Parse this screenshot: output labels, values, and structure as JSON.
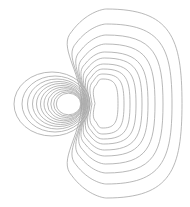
{
  "diagram": {
    "title": "",
    "type": "contour-field-lines",
    "stroke_color": "#a6a6a6",
    "background": "#ffffff",
    "left_lobe": {
      "center": [
        52,
        104
      ],
      "contours": [
        {
          "rx": 38,
          "ry": 32,
          "cx": 52,
          "cy": 104
        },
        {
          "rx": 33,
          "ry": 28,
          "cx": 55,
          "cy": 104
        },
        {
          "rx": 29.5,
          "ry": 25,
          "cx": 57,
          "cy": 104
        },
        {
          "rx": 26.5,
          "ry": 22.5,
          "cx": 59,
          "cy": 104
        },
        {
          "rx": 24,
          "ry": 20.5,
          "cx": 60.5,
          "cy": 104
        },
        {
          "rx": 21.5,
          "ry": 18.5,
          "cx": 62,
          "cy": 104
        },
        {
          "rx": 19.5,
          "ry": 16.8,
          "cx": 63.5,
          "cy": 104
        },
        {
          "rx": 17.5,
          "ry": 15.2,
          "cx": 65,
          "cy": 104
        },
        {
          "rx": 15.5,
          "ry": 13.6,
          "cx": 66.3,
          "cy": 104
        },
        {
          "rx": 13.8,
          "ry": 12.2,
          "cx": 67.5,
          "cy": 104
        },
        {
          "rx": 12.2,
          "ry": 10.8,
          "cx": 68.5,
          "cy": 104
        }
      ]
    },
    "right_lobe": {
      "contours": [
        {
          "left": 60,
          "right": 182,
          "top": 9,
          "bottom": 198,
          "pinch": 82
        },
        {
          "left": 66,
          "right": 172,
          "top": 24,
          "bottom": 184,
          "pinch": 84
        },
        {
          "left": 71,
          "right": 163,
          "top": 35,
          "bottom": 173,
          "pinch": 85
        },
        {
          "left": 75,
          "right": 155,
          "top": 44,
          "bottom": 164,
          "pinch": 86
        },
        {
          "left": 78,
          "right": 148,
          "top": 52,
          "bottom": 156,
          "pinch": 87
        },
        {
          "left": 81,
          "right": 142,
          "top": 58,
          "bottom": 150,
          "pinch": 88
        },
        {
          "left": 84,
          "right": 136,
          "top": 64,
          "bottom": 144,
          "pinch": 89
        },
        {
          "left": 87,
          "right": 130,
          "top": 69,
          "bottom": 139,
          "pinch": 90
        },
        {
          "left": 90,
          "right": 124,
          "top": 74,
          "bottom": 134,
          "pinch": 92
        },
        {
          "left": 94,
          "right": 118,
          "top": 79,
          "bottom": 128,
          "pinch": 95
        }
      ]
    }
  }
}
